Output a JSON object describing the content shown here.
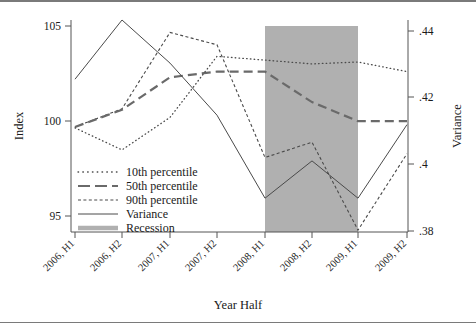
{
  "figure": {
    "background": "#ffffff",
    "frame_color": "#7a7a7a",
    "axis_color": "#555555",
    "series_color": "#4a4a4a",
    "recession_color": "#b0b0b0"
  },
  "axes": {
    "left": {
      "title": "Index",
      "ticks": [
        "105",
        "100",
        "95"
      ],
      "tick_values": [
        105,
        100,
        95
      ],
      "range": [
        94.5,
        105.6
      ]
    },
    "right": {
      "title": "Variance",
      "ticks": [
        ".44",
        ".42",
        ".4",
        ".38"
      ],
      "tick_values": [
        0.44,
        0.42,
        0.4,
        0.38
      ],
      "range": [
        0.3778,
        0.4437
      ]
    },
    "bottom": {
      "title": "Year Half",
      "ticks": [
        "2006, H1",
        "2006, H2",
        "2007, H1",
        "2007, H2",
        "2008, H1",
        "2008, H2",
        "2009, H1",
        "2009, H2"
      ]
    }
  },
  "legend": {
    "items": [
      {
        "label": "10th percentile",
        "style": "dotted"
      },
      {
        "label": "50th percentile",
        "style": "long-dash"
      },
      {
        "label": "90th percentile",
        "style": "short-dash"
      },
      {
        "label": "Variance",
        "style": "solid"
      },
      {
        "label": "Recession",
        "style": "thick-gray"
      }
    ]
  },
  "chart_data": {
    "type": "line",
    "title": "",
    "xlabel": "Year Half",
    "ylabel": "Index",
    "y2label": "Variance",
    "categories": [
      "2006, H1",
      "2006, H2",
      "2007, H1",
      "2007, H2",
      "2008, H1",
      "2008, H2",
      "2009, H1",
      "2009, H2"
    ],
    "ylim": [
      94.5,
      105.6
    ],
    "y2lim": [
      0.3778,
      0.4437
    ],
    "grid": false,
    "legend_position": "inside-lower-left",
    "series": [
      {
        "name": "10th percentile",
        "axis": "left",
        "style": "dotted",
        "values": [
          99.95,
          98.8,
          100.5,
          103.7,
          103.5,
          103.3,
          103.4,
          102.9
        ]
      },
      {
        "name": "50th percentile",
        "axis": "left",
        "style": "long-dash",
        "values": [
          100.0,
          100.9,
          102.6,
          102.9,
          102.9,
          101.3,
          100.3,
          100.3
        ]
      },
      {
        "name": "90th percentile",
        "axis": "left",
        "style": "short-dash",
        "values": [
          100.0,
          100.95,
          104.95,
          104.3,
          98.4,
          99.2,
          94.6,
          98.6
        ]
      },
      {
        "name": "Variance",
        "axis": "right",
        "style": "solid",
        "values": [
          0.4253,
          0.4437,
          0.4303,
          0.4141,
          0.3883,
          0.3999,
          0.3883,
          0.4112
        ]
      }
    ],
    "annotations": [
      {
        "name": "Recession",
        "type": "shaded-band",
        "from": "2008, H1",
        "to": "2009, H1",
        "color": "#b0b0b0"
      }
    ]
  }
}
